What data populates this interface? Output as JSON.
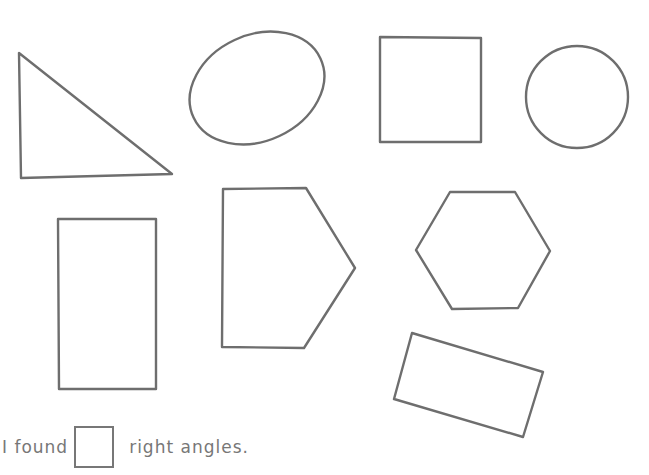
{
  "worksheet": {
    "footer": {
      "prefix": "I found",
      "suffix": "right angles.",
      "answer_value": ""
    },
    "shapes": [
      {
        "name": "right-triangle",
        "type": "polygon",
        "points": "19,53 21,178 172,174"
      },
      {
        "name": "oval",
        "type": "ellipse",
        "cx": 257,
        "cy": 88,
        "rx": 70,
        "ry": 53,
        "rotate": -25
      },
      {
        "name": "square",
        "type": "polygon",
        "points": "380,37 481,38 481,142 380,142"
      },
      {
        "name": "circle",
        "type": "circle",
        "cx": 577,
        "cy": 97,
        "r": 51
      },
      {
        "name": "rectangle",
        "type": "polygon",
        "points": "58,219 156,219 156,389 59,389"
      },
      {
        "name": "pentagon",
        "type": "polygon",
        "points": "223,189 306,188 355,268 304,348 222,347"
      },
      {
        "name": "hexagon",
        "type": "polygon",
        "points": "450,192 515,192 550,251 518,308 452,309 416,250"
      },
      {
        "name": "tilted-rectangle",
        "type": "polygon",
        "points": "412,333 543,372 523,437 394,399"
      }
    ],
    "stroke_color": "#6e6e6e"
  }
}
